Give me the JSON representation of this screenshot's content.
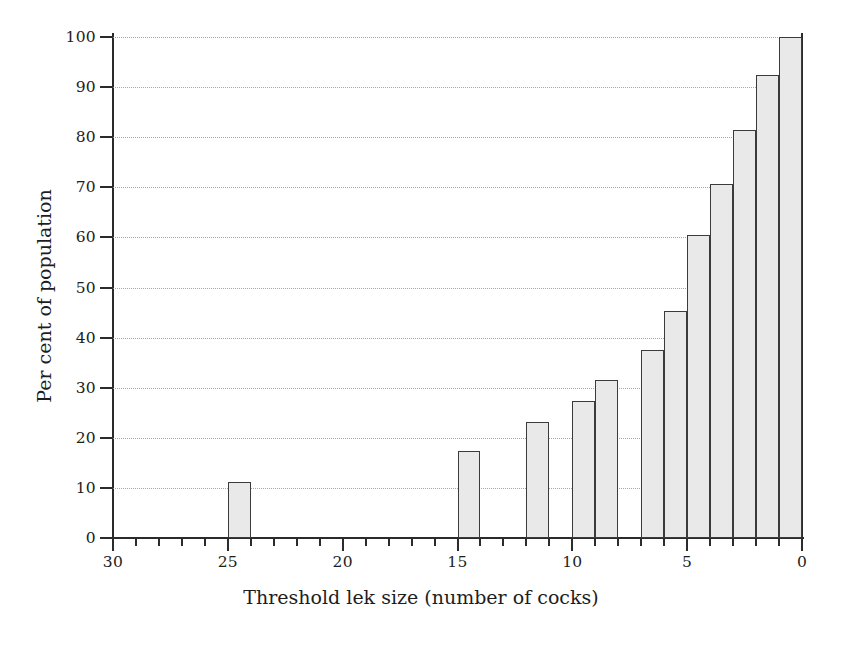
{
  "chart_data": {
    "type": "bar",
    "title": "",
    "xlabel": "Threshold lek size (number of cocks)",
    "ylabel": "Per cent of population",
    "categories": [
      25,
      15,
      12,
      10,
      9,
      7,
      6,
      5,
      4,
      3,
      2,
      1
    ],
    "values": [
      11.2,
      17.3,
      23.2,
      27.4,
      31.5,
      37.5,
      45.4,
      60.5,
      70.6,
      81.5,
      92.5,
      100.0
    ],
    "xlim": [
      30,
      0
    ],
    "ylim": [
      0,
      100
    ],
    "x_axis_reversed": true,
    "x_tick_labels": [
      "30",
      "25",
      "20",
      "15",
      "10",
      "5",
      "0"
    ],
    "x_major_ticks": [
      30,
      25,
      20,
      15,
      10,
      5,
      0
    ],
    "x_minor_tick_interval": 1,
    "y_tick_labels": [
      "0",
      "10",
      "20",
      "30",
      "40",
      "50",
      "60",
      "70",
      "80",
      "90",
      "100"
    ],
    "y_ticks": [
      0,
      10,
      20,
      30,
      40,
      50,
      60,
      70,
      80,
      90,
      100
    ],
    "grid": "horizontal-dotted",
    "legend": null,
    "bar_fill_color": "#e9e9e9",
    "bar_edge_color": "#3b3b3b",
    "gridline_color": "#9a9a9a",
    "axis_color": "#2b2b2b",
    "bar_width_units": 1
  }
}
